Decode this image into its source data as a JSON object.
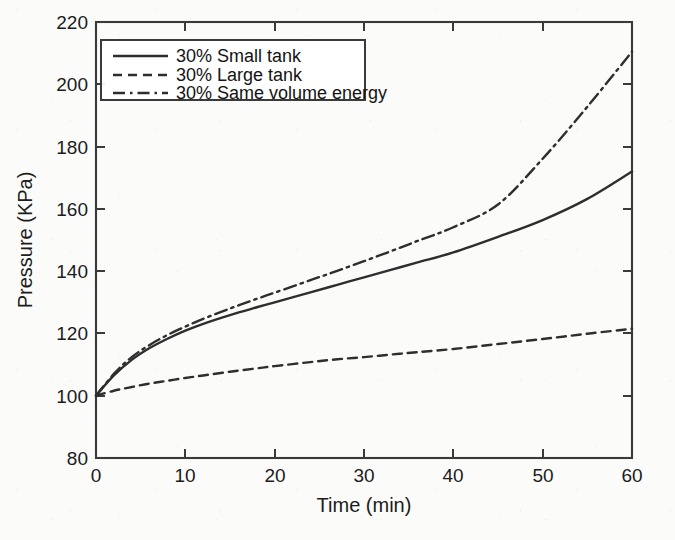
{
  "chart_data": {
    "type": "line",
    "title": "",
    "xlabel": "Time (min)",
    "ylabel": "Pressure (KPa)",
    "xlim": [
      0,
      60
    ],
    "ylim": [
      80,
      220
    ],
    "xticks": [
      0,
      10,
      20,
      30,
      40,
      50,
      60
    ],
    "yticks": [
      80,
      100,
      120,
      140,
      160,
      180,
      200,
      220
    ],
    "grid": false,
    "legend_position": "upper left",
    "x": [
      0,
      2,
      4,
      6,
      8,
      10,
      12,
      15,
      18,
      20,
      24,
      27,
      30,
      33,
      36,
      40,
      45,
      50,
      55,
      60
    ],
    "series": [
      {
        "name": "30% Small tank",
        "style": "solid",
        "color": "#2e2e2e",
        "values": [
          100,
          106.5,
          111.5,
          115.3,
          118.3,
          120.9,
          123.1,
          125.9,
          128.4,
          130.0,
          133.2,
          135.6,
          138.0,
          140.4,
          142.8,
          146.0,
          151.0,
          156.4,
          163.2,
          172.0
        ]
      },
      {
        "name": "30% Large tank",
        "style": "dashed",
        "color": "#2e2e2e",
        "values": [
          100,
          101.6,
          102.8,
          103.9,
          104.8,
          105.7,
          106.5,
          107.7,
          108.8,
          109.5,
          110.8,
          111.7,
          112.4,
          113.2,
          114.0,
          115.0,
          116.6,
          118.2,
          119.9,
          121.5
        ]
      },
      {
        "name": "30% Same volume energy",
        "style": "dashdot",
        "color": "#2e2e2e",
        "values": [
          100,
          107.0,
          112.4,
          116.3,
          119.5,
          122.2,
          124.7,
          128.0,
          131.1,
          133.1,
          137.1,
          140.1,
          143.2,
          146.4,
          149.7,
          154.1,
          161.4,
          176.1,
          192.8,
          210.5
        ]
      }
    ],
    "annotations": []
  },
  "axis": {
    "x_tick_labels": [
      "0",
      "10",
      "20",
      "30",
      "40",
      "50",
      "60"
    ],
    "y_tick_labels": [
      "80",
      "100",
      "120",
      "140",
      "160",
      "180",
      "200",
      "220"
    ],
    "x_title": "Time (min)",
    "y_title": "Pressure (KPa)"
  },
  "legend": {
    "entries": [
      {
        "label": "30% Small tank",
        "style": "solid"
      },
      {
        "label": "30% Large tank",
        "style": "dashed"
      },
      {
        "label": "30% Same volume energy",
        "style": "dashdot"
      }
    ]
  }
}
